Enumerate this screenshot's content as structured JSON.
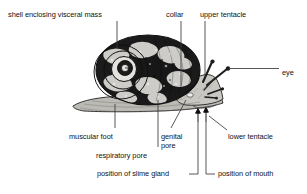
{
  "figure": {
    "background_color": "#ffffff",
    "ink_color": "#121212",
    "leader_line_color": "#3a3a3a",
    "shell_dark_color": "#1b1b1b",
    "shell_light_color": "#d8d6d2",
    "body_fill_color": "#c9c7c2",
    "foot_fill_color": "#bcbab5"
  },
  "labels": [
    {
      "id": "shell-enclosing-visceral-mass",
      "text": "shell enclosing visceral mass",
      "x": 8,
      "y": 11,
      "align": "left"
    },
    {
      "id": "collar",
      "text": "collar",
      "x": 166,
      "y": 11,
      "align": "left"
    },
    {
      "id": "upper-tentacle",
      "text": "upper tentacle",
      "x": 200,
      "y": 11,
      "align": "left"
    },
    {
      "id": "eye",
      "text": "eye",
      "x": 282,
      "y": 70,
      "align": "left"
    },
    {
      "id": "muscular-foot",
      "text": "muscular foot",
      "x": 69,
      "y": 133,
      "align": "left"
    },
    {
      "id": "genital-pore",
      "text": "genital pore",
      "x": 161,
      "y": 133,
      "align": "left",
      "wrap_width": 28
    },
    {
      "id": "lower-tentacle",
      "text": "lower tentacle",
      "x": 228,
      "y": 133,
      "align": "left"
    },
    {
      "id": "respiratory-pore",
      "text": "respiratory pore",
      "x": 96,
      "y": 152,
      "align": "left"
    },
    {
      "id": "position-of-slime-gland",
      "text": "position of slime gland",
      "x": 97,
      "y": 177,
      "align": "left"
    },
    {
      "id": "position-of-mouth",
      "text": "position of mouth",
      "x": 218,
      "y": 177,
      "align": "left"
    }
  ],
  "leaders": [
    {
      "id": "leader-shell",
      "type": "vertical",
      "x": 117,
      "y1": 21,
      "y2": 48
    },
    {
      "id": "leader-collar",
      "type": "vertical",
      "x": 181,
      "y1": 21,
      "y2": 86
    },
    {
      "id": "leader-upper-tentacle",
      "type": "vertical",
      "x": 205,
      "y1": 21,
      "y2": 77
    },
    {
      "id": "leader-eye",
      "type": "horizontal",
      "y": 73,
      "x1": 229,
      "x2": 279
    },
    {
      "id": "leader-muscular-foot",
      "type": "vertical",
      "x": 115,
      "y1": 104,
      "y2": 128
    },
    {
      "id": "leader-respiratory-pore",
      "type": "vertical",
      "x": 158,
      "y1": 100,
      "y2": 147
    },
    {
      "id": "leader-genital-pore",
      "type": "diagonal",
      "x1": 186,
      "x2": 171,
      "y1": 101,
      "y2": 128
    },
    {
      "id": "leader-lower-tentacle",
      "type": "diagonal",
      "x1": 208,
      "x2": 227,
      "y1": 116,
      "y2": 130
    },
    {
      "id": "leader-slime-gland",
      "type": "elbow-left",
      "x_up": 198,
      "y_top": 115,
      "y_bottom": 174,
      "x_end": 189
    },
    {
      "id": "leader-mouth",
      "type": "elbow-right",
      "x_up": 206,
      "y_top": 115,
      "y_bottom": 174,
      "x_end": 215
    }
  ],
  "arrows": [
    {
      "id": "arrow-slime-gland",
      "x": 198,
      "y_tip": 110,
      "y_tail": 121
    },
    {
      "id": "arrow-mouth",
      "x": 206,
      "y_tip": 109,
      "y_tail": 121
    }
  ],
  "anatomy_parts": [
    "shell enclosing visceral mass",
    "collar",
    "upper tentacle",
    "eye",
    "lower tentacle",
    "genital pore",
    "respiratory pore",
    "muscular foot",
    "position of slime gland",
    "position of mouth"
  ]
}
